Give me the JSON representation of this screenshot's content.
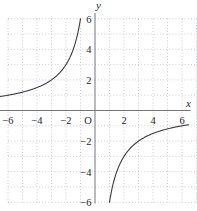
{
  "chart_data": {
    "type": "line",
    "title": "",
    "function": "y = -6/x",
    "k": -6,
    "xlabel": "x",
    "ylabel": "y",
    "origin_label": "O",
    "xlim": [
      -6,
      6
    ],
    "ylim": [
      -6,
      6
    ],
    "grid": {
      "style": "dotted",
      "spacing": 1,
      "visible": true
    },
    "asymptotes": {
      "vertical": "x = 0",
      "horizontal": "y = 0"
    },
    "x_ticks": [
      {
        "v": -6,
        "label": "−6"
      },
      {
        "v": -4,
        "label": "−4"
      },
      {
        "v": -2,
        "label": "−2"
      },
      {
        "v": 2,
        "label": "2"
      },
      {
        "v": 4,
        "label": "4"
      },
      {
        "v": 6,
        "label": "6"
      }
    ],
    "y_ticks": [
      {
        "v": 6,
        "label": "6"
      },
      {
        "v": 4,
        "label": "4"
      },
      {
        "v": 2,
        "label": "2"
      },
      {
        "v": -2,
        "label": "−2"
      },
      {
        "v": -4,
        "label": "−4"
      },
      {
        "v": -6,
        "label": "−6"
      }
    ],
    "series": [
      {
        "name": "branch-quadrant-2",
        "x_range": [
          -6.55,
          -1
        ],
        "points": [
          [
            -6,
            1
          ],
          [
            -5,
            1.2
          ],
          [
            -4,
            1.5
          ],
          [
            -3,
            2
          ],
          [
            -2,
            3
          ],
          [
            -1.5,
            4
          ],
          [
            -1,
            6
          ]
        ]
      },
      {
        "name": "branch-quadrant-4",
        "x_range": [
          1,
          6.45
        ],
        "points": [
          [
            1,
            -6
          ],
          [
            1.5,
            -4
          ],
          [
            2,
            -3
          ],
          [
            3,
            -2
          ],
          [
            4,
            -1.5
          ],
          [
            5,
            -1.2
          ],
          [
            6,
            -1
          ]
        ]
      }
    ],
    "colors": {
      "curve": "#3a3c40",
      "axis": "#74777c",
      "grid": "#b6bac1",
      "text": "#26282c",
      "background": "#ffffff"
    }
  }
}
